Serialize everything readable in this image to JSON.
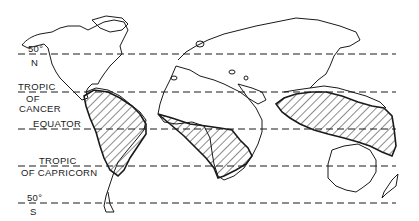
{
  "map": {
    "type": "world map (equirectangular sketch)",
    "style": "black line drawing on white",
    "colors": {
      "ink": "#1a1a1a",
      "background": "#ffffff"
    },
    "latitude_lines": [
      {
        "id": "lat-50n",
        "label_top": "50°",
        "label_bottom": "N",
        "y": 54
      },
      {
        "id": "tropic-cancer",
        "label_top": "TROPIC",
        "label_mid": "OF",
        "label_bottom": "CANCER",
        "y": 92
      },
      {
        "id": "equator",
        "label": "EQUATOR",
        "y": 129
      },
      {
        "id": "tropic-capricorn",
        "label_top": "TROPIC",
        "label_bottom": "OF CAPRICORN",
        "y": 166
      },
      {
        "id": "lat-50s",
        "label_top": "50°",
        "label_bottom": "S",
        "y": 203
      }
    ],
    "hatched_regions": [
      {
        "name": "South America tropical region"
      },
      {
        "name": "Africa tropical region"
      },
      {
        "name": "Southeast Asia / Oceania tropical region"
      }
    ]
  }
}
